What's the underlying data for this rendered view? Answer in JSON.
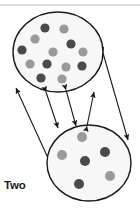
{
  "figure": {
    "canvas": {
      "width": 140,
      "height": 214,
      "background": "#ffffff"
    },
    "top_rule": {
      "y": 5,
      "color": "#b8b8b8",
      "x1": 0,
      "x2": 140
    },
    "caption": {
      "line1": "Two",
      "line2": "species",
      "color": "#1a1a1a"
    },
    "colors": {
      "outline": "#1a1a1a",
      "circle_fill": "#f7f7f7",
      "dot_dark": "#4a4a4a",
      "dot_light": "#9a9a9a",
      "arrow": "#1a1a1a"
    },
    "circles": [
      {
        "name": "top-population",
        "cx": 58,
        "cy": 52,
        "rx": 45,
        "ry": 40,
        "dot_count": 13,
        "dots": [
          {
            "cx": 45,
            "cy": 28,
            "r": 4.6,
            "shade": "dark"
          },
          {
            "cx": 64,
            "cy": 29,
            "r": 4.6,
            "shade": "light"
          },
          {
            "cx": 35,
            "cy": 39,
            "r": 4.6,
            "shade": "light"
          },
          {
            "cx": 71,
            "cy": 44,
            "r": 4.6,
            "shade": "dark"
          },
          {
            "cx": 22,
            "cy": 50,
            "r": 4.6,
            "shade": "dark"
          },
          {
            "cx": 53,
            "cy": 52,
            "r": 4.6,
            "shade": "light"
          },
          {
            "cx": 83,
            "cy": 52,
            "r": 4.6,
            "shade": "light"
          },
          {
            "cx": 30,
            "cy": 64,
            "r": 4.6,
            "shade": "light"
          },
          {
            "cx": 47,
            "cy": 64,
            "r": 4.6,
            "shade": "dark"
          },
          {
            "cx": 66,
            "cy": 67,
            "r": 4.6,
            "shade": "light"
          },
          {
            "cx": 82,
            "cy": 66,
            "r": 4.6,
            "shade": "dark"
          },
          {
            "cx": 41,
            "cy": 78,
            "r": 4.6,
            "shade": "dark"
          },
          {
            "cx": 62,
            "cy": 79,
            "r": 4.6,
            "shade": "light"
          }
        ]
      },
      {
        "name": "bottom-population",
        "cx": 89,
        "cy": 163,
        "rx": 42,
        "ry": 38,
        "dot_count": 6,
        "dots": [
          {
            "cx": 82,
            "cy": 137,
            "r": 5.0,
            "shade": "light"
          },
          {
            "cx": 105,
            "cy": 152,
            "r": 5.0,
            "shade": "dark"
          },
          {
            "cx": 62,
            "cy": 155,
            "r": 5.0,
            "shade": "light"
          },
          {
            "cx": 85,
            "cy": 161,
            "r": 5.0,
            "shade": "dark"
          },
          {
            "cx": 110,
            "cy": 176,
            "r": 5.0,
            "shade": "light"
          },
          {
            "cx": 79,
            "cy": 184,
            "r": 5.0,
            "shade": "dark"
          }
        ]
      }
    ],
    "connector_arrows": [
      {
        "name": "outer-left-arrow",
        "x1": 48,
        "y1": 158,
        "x2": 16,
        "y2": 88,
        "double_headed": true
      },
      {
        "name": "outer-right-arrow",
        "x1": 103,
        "y1": 53,
        "x2": 128,
        "y2": 140,
        "double_headed": true
      },
      {
        "name": "inner-arrow-1",
        "x1": 46,
        "y1": 92,
        "x2": 58,
        "y2": 128,
        "double_headed": true
      },
      {
        "name": "inner-arrow-2",
        "x1": 66,
        "y1": 90,
        "x2": 76,
        "y2": 126,
        "double_headed": true
      },
      {
        "name": "inner-arrow-3",
        "x1": 87,
        "y1": 126,
        "x2": 94,
        "y2": 92,
        "double_headed": true
      }
    ]
  }
}
